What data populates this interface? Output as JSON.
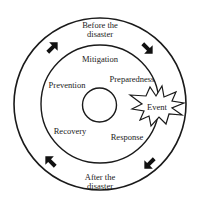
{
  "diagram": {
    "outer_ring": {
      "top_label": [
        "Before the",
        "disaster"
      ],
      "bottom_label": [
        "After the",
        "disaster"
      ]
    },
    "phases": [
      {
        "label": "Mitigation"
      },
      {
        "label": "Preparedness"
      },
      {
        "label": "Prevention"
      },
      {
        "label": "Recovery"
      },
      {
        "label": "Response"
      }
    ],
    "event": {
      "label": "Event"
    },
    "arrows": [
      {
        "position": "top-left",
        "direction": "clockwise"
      },
      {
        "position": "top-right",
        "direction": "clockwise"
      },
      {
        "position": "bottom-right",
        "direction": "clockwise"
      },
      {
        "position": "bottom-left",
        "direction": "clockwise"
      }
    ],
    "colors": {
      "stroke": "#1a1a1a",
      "text": "#222222",
      "background": "#ffffff"
    }
  }
}
